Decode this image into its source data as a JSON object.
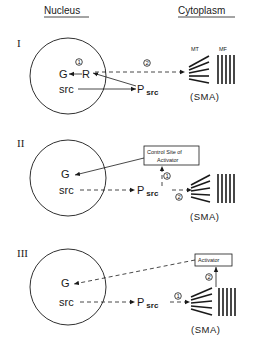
{
  "headers": {
    "left": "Nucleus",
    "right": "Cytoplasm"
  },
  "labels": {
    "mt": "MT",
    "mf": "MF",
    "sma": "(SMA)",
    "gene": "G",
    "receptor": "R",
    "src": "src",
    "p": "P",
    "p_sub": "src",
    "step1": "1",
    "step2": "2"
  },
  "panels": [
    {
      "id": "I",
      "roman": "I",
      "description": "R acts on G (step 1); R dashed link to SMA (step 2); src -> Psrc -> R"
    },
    {
      "id": "II",
      "roman": "II",
      "box_line1": "Control Site of",
      "box_line2": "Activator",
      "description": "src -> Psrc; SMA to Psrc (step 2); to Control Site of Activator (step 1); box -> G"
    },
    {
      "id": "III",
      "roman": "III",
      "box_line1": "Activator",
      "description": "src -> Psrc -> SMA (step 1); SMA -> Activator (step 2); Activator -> G dashed"
    }
  ],
  "colors": {
    "ink": "#1a1a1a",
    "background": "#ffffff"
  }
}
